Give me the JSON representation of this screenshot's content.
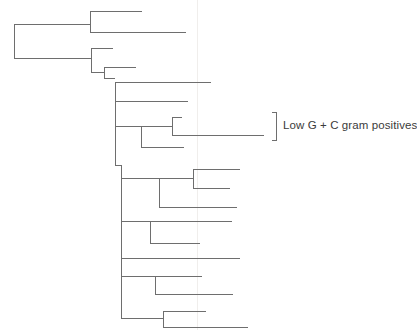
{
  "figure": {
    "type": "phylogenetic-tree",
    "width": 417,
    "height": 330,
    "background_color": "#ffffff",
    "line_color": "#6e6e6e",
    "line_width": 1,
    "text_color": "#3b3b3b",
    "orientation": "left-to-right-rectangular-cladogram",
    "scan_artifact": {
      "present": true,
      "kind": "faint-vertical-scan-line",
      "x": 197,
      "color": "#f0eeec"
    }
  },
  "annotations": [
    {
      "id": "low-gc-bracket",
      "label": "Low G + C gram positives",
      "bracket": {
        "x": 276,
        "y_top": 112,
        "y_bottom": 140,
        "tick_length": 5
      },
      "text_x": 283,
      "text_y": 120
    }
  ],
  "tree": {
    "root": {
      "x": 14,
      "y_top": 24,
      "y_bottom": 58
    },
    "nodes": [
      {
        "id": "n-root",
        "x": 14,
        "y_top": 24,
        "y_bottom": 58
      },
      {
        "id": "n-cladeA",
        "x": 90,
        "y_top": 11,
        "y_bottom": 32
      },
      {
        "id": "n-cladeB",
        "x": 91,
        "y_top": 48,
        "y_bottom": 72
      },
      {
        "id": "n-cladeB2",
        "x": 104,
        "y_top": 67,
        "y_bottom": 78
      },
      {
        "id": "n-cladeC",
        "x": 115,
        "y_top": 82,
        "y_bottom": 101
      },
      {
        "id": "n-spine",
        "x": 115,
        "y_top": 91,
        "y_bottom": 165
      },
      {
        "id": "n-lowgc",
        "x": 141,
        "y_top": 126,
        "y_bottom": 147
      },
      {
        "id": "n-lowgc-pair",
        "x": 172,
        "y_top": 117,
        "y_bottom": 135
      },
      {
        "id": "n-lower-spine",
        "x": 121,
        "y_top": 147,
        "y_bottom": 318
      },
      {
        "id": "n-sub1",
        "x": 159,
        "y_top": 178,
        "y_bottom": 207
      },
      {
        "id": "n-sub1-pair",
        "x": 193,
        "y_top": 169,
        "y_bottom": 188
      },
      {
        "id": "n-sub2",
        "x": 150,
        "y_top": 221,
        "y_bottom": 243
      },
      {
        "id": "n-sub3",
        "x": 155,
        "y_top": 276,
        "y_bottom": 294
      },
      {
        "id": "n-sub4",
        "x": 163,
        "y_top": 311,
        "y_bottom": 327
      }
    ],
    "branches": [
      {
        "id": "b-root-to-cladeA",
        "x1": 14,
        "x2": 90,
        "y": 24
      },
      {
        "id": "b-root-to-cladeB",
        "x1": 14,
        "x2": 91,
        "y": 58
      },
      {
        "id": "b-cladeA-tip1",
        "x1": 90,
        "x2": 142,
        "y": 11
      },
      {
        "id": "b-cladeA-tip2",
        "x1": 90,
        "x2": 186,
        "y": 32
      },
      {
        "id": "b-cladeB-tip1",
        "x1": 91,
        "x2": 113,
        "y": 48
      },
      {
        "id": "b-cladeB-to-b2",
        "x1": 91,
        "x2": 104,
        "y": 72
      },
      {
        "id": "b-cladeB2-tip1",
        "x1": 104,
        "x2": 136,
        "y": 67
      },
      {
        "id": "b-cladeB2-to-c",
        "x1": 104,
        "x2": 115,
        "y": 78
      },
      {
        "id": "b-cladeC-tip1",
        "x1": 115,
        "x2": 211,
        "y": 82
      },
      {
        "id": "b-cladeC-tip2",
        "x1": 115,
        "x2": 188,
        "y": 101
      },
      {
        "id": "b-spine-to-lowgc",
        "x1": 115,
        "x2": 141,
        "y": 126
      },
      {
        "id": "b-spine-to-lower",
        "x1": 115,
        "x2": 121,
        "y": 165
      },
      {
        "id": "b-lowgc-to-pair",
        "x1": 141,
        "x2": 172,
        "y": 126
      },
      {
        "id": "b-lowgc-pair-tip1",
        "x1": 172,
        "x2": 182,
        "y": 117
      },
      {
        "id": "b-lowgc-pair-tip2",
        "x1": 172,
        "x2": 264,
        "y": 135
      },
      {
        "id": "b-lowgc-tip3",
        "x1": 141,
        "x2": 184,
        "y": 147
      },
      {
        "id": "b-lower-to-sub1",
        "x1": 121,
        "x2": 159,
        "y": 178
      },
      {
        "id": "b-sub1-to-pair",
        "x1": 159,
        "x2": 193,
        "y": 178
      },
      {
        "id": "b-sub1-pair-tip1",
        "x1": 193,
        "x2": 240,
        "y": 169
      },
      {
        "id": "b-sub1-pair-tip2",
        "x1": 193,
        "x2": 230,
        "y": 188
      },
      {
        "id": "b-sub1-tip3",
        "x1": 159,
        "x2": 237,
        "y": 207
      },
      {
        "id": "b-lower-to-sub2",
        "x1": 121,
        "x2": 150,
        "y": 221
      },
      {
        "id": "b-sub2-tip1",
        "x1": 150,
        "x2": 232,
        "y": 221
      },
      {
        "id": "b-sub2-tip2",
        "x1": 150,
        "x2": 200,
        "y": 243
      },
      {
        "id": "b-lower-tip-mid",
        "x1": 121,
        "x2": 240,
        "y": 258
      },
      {
        "id": "b-lower-to-sub3",
        "x1": 121,
        "x2": 155,
        "y": 276
      },
      {
        "id": "b-sub3-tip1",
        "x1": 155,
        "x2": 202,
        "y": 276
      },
      {
        "id": "b-sub3-tip2",
        "x1": 155,
        "x2": 233,
        "y": 294
      },
      {
        "id": "b-lower-to-sub4",
        "x1": 121,
        "x2": 163,
        "y": 318
      },
      {
        "id": "b-sub4-tip1",
        "x1": 163,
        "x2": 206,
        "y": 311
      },
      {
        "id": "b-sub4-tip2",
        "x1": 163,
        "x2": 248,
        "y": 327
      }
    ],
    "verticals": [
      {
        "id": "v-root",
        "x": 14,
        "y1": 24,
        "y2": 58
      },
      {
        "id": "v-cladeA",
        "x": 90,
        "y1": 11,
        "y2": 32
      },
      {
        "id": "v-cladeB",
        "x": 91,
        "y1": 48,
        "y2": 72
      },
      {
        "id": "v-cladeB2",
        "x": 104,
        "y1": 67,
        "y2": 78
      },
      {
        "id": "v-cladeC-spine",
        "x": 115,
        "y1": 82,
        "y2": 165
      },
      {
        "id": "v-lowgc",
        "x": 141,
        "y1": 126,
        "y2": 147
      },
      {
        "id": "v-lowgc-pair",
        "x": 172,
        "y1": 117,
        "y2": 135
      },
      {
        "id": "v-lower-spine",
        "x": 121,
        "y1": 165,
        "y2": 318
      },
      {
        "id": "v-sub1",
        "x": 159,
        "y1": 178,
        "y2": 207
      },
      {
        "id": "v-sub1-pair",
        "x": 193,
        "y1": 169,
        "y2": 188
      },
      {
        "id": "v-sub2",
        "x": 150,
        "y1": 221,
        "y2": 243
      },
      {
        "id": "v-sub3",
        "x": 155,
        "y1": 276,
        "y2": 294
      },
      {
        "id": "v-sub4",
        "x": 163,
        "y1": 311,
        "y2": 327
      }
    ]
  }
}
